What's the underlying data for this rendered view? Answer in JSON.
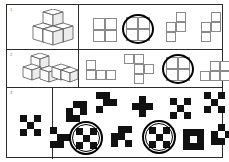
{
  "sheet": {
    "title": "Spatial reasoning worksheet",
    "background_color": "#ffffff",
    "ink_color": "#2b2b2b",
    "grid_line_color": "#8a8a8a",
    "fill_black": "#111111",
    "fill_white": "#ffffff"
  },
  "rows": [
    {
      "label": "1",
      "prompt_type": "isometric-cube-stack",
      "prompt": {
        "name": "cube-stack-four-cubes",
        "cube_count": 4,
        "description": "Four unit cubes: an L-shaped base of three cubes with one cube stacked on top-left",
        "footprint_rows": 2,
        "footprint_cols": 2
      },
      "options": [
        {
          "id": "1a",
          "name": "square-tetromino",
          "shape": "O",
          "grid": [
            [
              1,
              1
            ],
            [
              1,
              1
            ]
          ],
          "circled": false
        },
        {
          "id": "1b",
          "name": "square-tetromino-circled",
          "shape": "O",
          "grid": [
            [
              1,
              1
            ],
            [
              1,
              1
            ]
          ],
          "circled": true
        },
        {
          "id": "1c",
          "name": "s-tetromino",
          "shape": "S",
          "grid": [
            [
              0,
              1
            ],
            [
              1,
              1
            ],
            [
              1,
              0
            ]
          ],
          "circled": false
        },
        {
          "id": "1d",
          "name": "s-tetromino-variant",
          "shape": "S",
          "grid": [
            [
              0,
              1
            ],
            [
              1,
              1
            ],
            [
              1,
              0
            ]
          ],
          "circled": false
        }
      ],
      "answer_id": "1b"
    },
    {
      "label": "2",
      "prompt_type": "isometric-cube-stack",
      "prompt": {
        "name": "cube-stack-five-cubes",
        "cube_count": 5,
        "description": "Five unit cubes forming a stepped arrangement with one cube raised on the left",
        "footprint_rows": 2,
        "footprint_cols": 3
      },
      "options": [
        {
          "id": "2a",
          "name": "j-tetromino",
          "shape": "J",
          "grid": [
            [
              1,
              0,
              0
            ],
            [
              1,
              1,
              1
            ]
          ],
          "circled": false
        },
        {
          "id": "2b",
          "name": "s-pentomino",
          "shape": "S-penta",
          "grid": [
            [
              1,
              1,
              0
            ],
            [
              0,
              1,
              1
            ],
            [
              0,
              1,
              0
            ]
          ],
          "circled": false
        },
        {
          "id": "2c",
          "name": "square-tetromino-circled",
          "shape": "O",
          "grid": [
            [
              1,
              1
            ],
            [
              1,
              1
            ]
          ],
          "circled": true
        },
        {
          "id": "2d",
          "name": "p-pentomino",
          "shape": "P",
          "grid": [
            [
              0,
              1,
              1
            ],
            [
              1,
              1,
              0
            ]
          ],
          "circled": false
        }
      ],
      "answer_id": "2c"
    },
    {
      "label": "3",
      "prompt_type": "checker-pattern",
      "prompt": {
        "name": "checker-reference-3x3",
        "size": 3,
        "cells": [
          [
            1,
            0,
            1
          ],
          [
            0,
            1,
            0
          ],
          [
            1,
            0,
            1
          ]
        ],
        "description": "3 by 3 checkerboard, black on the four corners and the centre"
      },
      "options": [
        {
          "id": "3a",
          "name": "checker-diagonal-a",
          "size": 3,
          "cells": [
            [
              0,
              1,
              1
            ],
            [
              1,
              0,
              1
            ],
            [
              1,
              1,
              0
            ]
          ],
          "circled": false
        },
        {
          "id": "3b",
          "name": "checker-diagonal-b",
          "size": 3,
          "cells": [
            [
              1,
              1,
              0
            ],
            [
              0,
              1,
              1
            ],
            [
              1,
              0,
              0
            ]
          ],
          "circled": false
        },
        {
          "id": "3c",
          "name": "checker-plus-cross",
          "size": 3,
          "cells": [
            [
              0,
              1,
              0
            ],
            [
              1,
              1,
              1
            ],
            [
              0,
              1,
              0
            ]
          ],
          "circled": false
        },
        {
          "id": "3d",
          "name": "checker-x-corners",
          "size": 3,
          "cells": [
            [
              1,
              0,
              1
            ],
            [
              0,
              1,
              0
            ],
            [
              1,
              0,
              1
            ]
          ],
          "circled": false
        },
        {
          "id": "3e",
          "name": "checker-alt-corners",
          "size": 3,
          "cells": [
            [
              1,
              0,
              1
            ],
            [
              0,
              1,
              0
            ],
            [
              1,
              0,
              1
            ]
          ],
          "circled": false
        },
        {
          "id": "3f",
          "name": "checker-corner-block",
          "size": 3,
          "cells": [
            [
              1,
              0,
              0
            ],
            [
              0,
              1,
              1
            ],
            [
              1,
              1,
              0
            ]
          ],
          "circled": false
        },
        {
          "id": "3g",
          "name": "checker-circled-left",
          "size": 3,
          "cells": [
            [
              1,
              0,
              1
            ],
            [
              0,
              1,
              0
            ],
            [
              1,
              0,
              1
            ]
          ],
          "circled": true
        },
        {
          "id": "3h",
          "name": "checker-zigzag",
          "size": 3,
          "cells": [
            [
              0,
              1,
              1
            ],
            [
              1,
              1,
              0
            ],
            [
              1,
              0,
              1
            ]
          ],
          "circled": false
        },
        {
          "id": "3i",
          "name": "checker-circled-right",
          "size": 3,
          "cells": [
            [
              1,
              0,
              1
            ],
            [
              0,
              1,
              0
            ],
            [
              1,
              0,
              1
            ]
          ],
          "circled": true
        },
        {
          "id": "3j",
          "name": "checker-inverse-center",
          "size": 3,
          "cells": [
            [
              1,
              1,
              1
            ],
            [
              1,
              0,
              1
            ],
            [
              1,
              1,
              1
            ]
          ],
          "circled": false
        },
        {
          "id": "3k",
          "name": "checker-mixed",
          "size": 3,
          "cells": [
            [
              0,
              1,
              0
            ],
            [
              1,
              0,
              1
            ],
            [
              1,
              1,
              0
            ]
          ],
          "circled": false
        }
      ],
      "answer_ids": [
        "3g",
        "3i"
      ]
    }
  ]
}
